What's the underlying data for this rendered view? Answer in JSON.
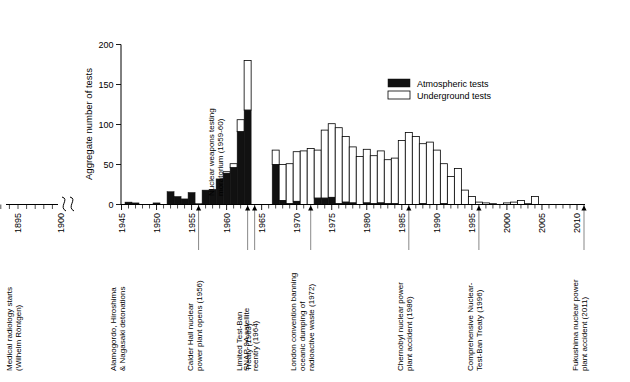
{
  "chart_data": {
    "type": "bar",
    "title": "",
    "subtitle": "",
    "xlabel": "",
    "ylabel": "Aggregate number of tests",
    "ylim": [
      0,
      200
    ],
    "yticks": [
      0,
      50,
      100,
      150,
      200
    ],
    "xlim": [
      1944,
      2013
    ],
    "xticks": [
      1895,
      1900,
      1945,
      1950,
      1955,
      1960,
      1965,
      1970,
      1975,
      1980,
      1985,
      1990,
      1995,
      2000,
      2005,
      2010
    ],
    "axis_break_between": [
      1900,
      1945
    ],
    "grid": false,
    "legend_position": "top-right",
    "stacked": true,
    "series": [
      {
        "name": "Atmospheric tests",
        "color": "#111111",
        "values": [
          0,
          3,
          2,
          0,
          0,
          2,
          0,
          16,
          10,
          7,
          15,
          1,
          18,
          19,
          32,
          39,
          46,
          91,
          118,
          0,
          0,
          0,
          50,
          5,
          1,
          4,
          0,
          0,
          8,
          8,
          9,
          1,
          3,
          2,
          0,
          2,
          1,
          2,
          1,
          1,
          0,
          0,
          0,
          1,
          0,
          0,
          1,
          0,
          0,
          0,
          0,
          0,
          0,
          0,
          0,
          0,
          0,
          0,
          0,
          0,
          0,
          0,
          0,
          0,
          0,
          0,
          0,
          0,
          0
        ]
      },
      {
        "name": "Underground tests",
        "color": "#ffffff",
        "values": [
          0,
          0,
          0,
          0,
          0,
          0,
          0,
          0,
          0,
          0,
          0,
          0,
          0,
          0,
          0,
          2,
          5,
          15,
          62,
          0,
          0,
          0,
          18,
          45,
          50,
          62,
          67,
          70,
          60,
          85,
          92,
          95,
          82,
          70,
          60,
          67,
          60,
          65,
          55,
          57,
          80,
          90,
          85,
          75,
          78,
          68,
          50,
          35,
          45,
          18,
          10,
          3,
          2,
          1,
          0,
          2,
          3,
          5,
          1,
          10,
          0,
          0,
          0,
          0,
          0,
          0,
          0,
          0,
          0
        ]
      }
    ],
    "years": [
      1945,
      1946,
      1947,
      1948,
      1949,
      1950,
      1951,
      1952,
      1953,
      1954,
      1955,
      1956,
      1957,
      1958,
      1959,
      1960,
      1961,
      1962,
      1963,
      1964,
      1965,
      1966,
      1967,
      1968,
      1969,
      1970,
      1971,
      1972,
      1973,
      1974,
      1975,
      1976,
      1977,
      1978,
      1979,
      1980,
      1981,
      1982,
      1983,
      1984,
      1985,
      1986,
      1987,
      1988,
      1989,
      1990,
      1991,
      1992,
      1993,
      1994,
      1995,
      1996,
      1997,
      1998,
      1999,
      2000,
      2001,
      2002,
      2003,
      2004,
      2005,
      2006,
      2007,
      2008,
      2009,
      2010,
      2011,
      2012,
      2013
    ],
    "totals": [
      0,
      3,
      2,
      0,
      0,
      2,
      0,
      16,
      10,
      7,
      15,
      1,
      18,
      19,
      32,
      41,
      51,
      106,
      180,
      0,
      0,
      0,
      68,
      50,
      51,
      66,
      67,
      70,
      68,
      93,
      101,
      96,
      85,
      72,
      60,
      69,
      61,
      67,
      56,
      58,
      80,
      90,
      85,
      76,
      78,
      68,
      51,
      35,
      45,
      18,
      10,
      3,
      2,
      1,
      0,
      2,
      3,
      5,
      1,
      10,
      0,
      0,
      0,
      0,
      0,
      0,
      0,
      0,
      0
    ]
  },
  "legend": {
    "items": [
      {
        "label": "Atmospheric tests",
        "swatch": "filled",
        "color": "#111111"
      },
      {
        "label": "Underground tests",
        "swatch": "outline",
        "color": "#ffffff"
      }
    ]
  },
  "axes": {
    "y_title": "Aggregate number of tests",
    "y_ticks": [
      "0",
      "50",
      "100",
      "150",
      "200"
    ],
    "x_ticks": [
      "1895",
      "1900",
      "1945",
      "1950",
      "1955",
      "1960",
      "1965",
      "1970",
      "1975",
      "1980",
      "1985",
      "1990",
      "1995",
      "2000",
      "2005",
      "2010"
    ]
  },
  "inline_annotations": [
    {
      "id": "moratorium",
      "text_line1": "Nuclear weapons testing",
      "text_line2": "moratorium (1959-60)",
      "year": 1959
    }
  ],
  "bottom_annotations": [
    {
      "id": "medical-radiology",
      "lines": [
        "Medical radiology starts",
        "(Wilhelm Röntgen)"
      ],
      "year": 1895,
      "has_leader": false
    },
    {
      "id": "alamogordo",
      "lines": [
        "Alamogordo, Hiroshima",
        "& Nagasaki detonations"
      ],
      "year": 1945,
      "has_leader": false
    },
    {
      "id": "calder-hall",
      "lines": [
        "Calder Hall nuclear",
        "power plant opens (1956)"
      ],
      "year": 1956,
      "has_leader": true
    },
    {
      "id": "limited-test-ban",
      "lines": [
        "Limited Test-Ban",
        "Treaty (1963)"
      ],
      "year": 1963,
      "has_leader": true
    },
    {
      "id": "snap-9a",
      "lines": [
        "SNAP-9A satellite",
        "reentry (1964)"
      ],
      "year": 1964,
      "has_leader": true
    },
    {
      "id": "london-convention",
      "lines": [
        "London convention banning",
        "oceanic dumping of",
        "radioactive waste (1972)"
      ],
      "year": 1972,
      "has_leader": true
    },
    {
      "id": "chernobyl",
      "lines": [
        "Chernobyl nuclear power",
        "plant accident (1986)"
      ],
      "year": 1986,
      "has_leader": true
    },
    {
      "id": "ctbt",
      "lines": [
        "Comprehensive Nuclear-",
        "Test-Ban Treaty (1996)"
      ],
      "year": 1996,
      "has_leader": true
    },
    {
      "id": "fukushima",
      "lines": [
        "Fukushima nuclear power",
        "plant accident (2011)"
      ],
      "year": 2011,
      "has_leader": true
    }
  ]
}
